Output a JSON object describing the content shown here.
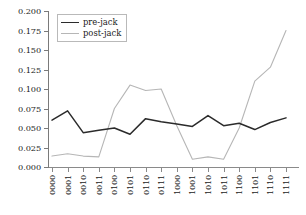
{
  "chart_data": {
    "type": "line",
    "title": "",
    "xlabel": "",
    "ylabel": "",
    "grid": false,
    "legend_position": "top-left",
    "xlim": [
      0,
      15
    ],
    "ylim": [
      0.0,
      0.2
    ],
    "ytick_labels": [
      "0.200",
      "0.175",
      "0.150",
      "0.125",
      "0.100",
      "0.075",
      "0.050",
      "0.025",
      "0.000"
    ],
    "ytick_values": [
      0.2,
      0.175,
      0.15,
      0.125,
      0.1,
      0.075,
      0.05,
      0.025,
      0.0
    ],
    "categories": [
      "0000",
      "0001",
      "0010",
      "0011",
      "0100",
      "0101",
      "0110",
      "0111",
      "1000",
      "1001",
      "1010",
      "1011",
      "1100",
      "1101",
      "1110",
      "1111"
    ],
    "series": [
      {
        "name": "pre-jack",
        "color": "#2b2b2b",
        "values": [
          0.06,
          0.072,
          0.044,
          0.047,
          0.05,
          0.042,
          0.062,
          0.058,
          0.055,
          0.052,
          0.066,
          0.053,
          0.056,
          0.048,
          0.057,
          0.063
        ]
      },
      {
        "name": "post-jack",
        "color": "#b6b6b6",
        "values": [
          0.014,
          0.017,
          0.014,
          0.013,
          0.075,
          0.105,
          0.098,
          0.1,
          0.053,
          0.01,
          0.013,
          0.01,
          0.05,
          0.11,
          0.128,
          0.175
        ]
      }
    ]
  },
  "legend": {
    "items": [
      {
        "label": "pre-jack"
      },
      {
        "label": "post-jack"
      }
    ]
  },
  "colors": {
    "pre_jack": "#2b2b2b",
    "post_jack": "#b6b6b6",
    "axis": "#7a7a7a",
    "text": "#1a1a1a",
    "background": "#ffffff"
  }
}
